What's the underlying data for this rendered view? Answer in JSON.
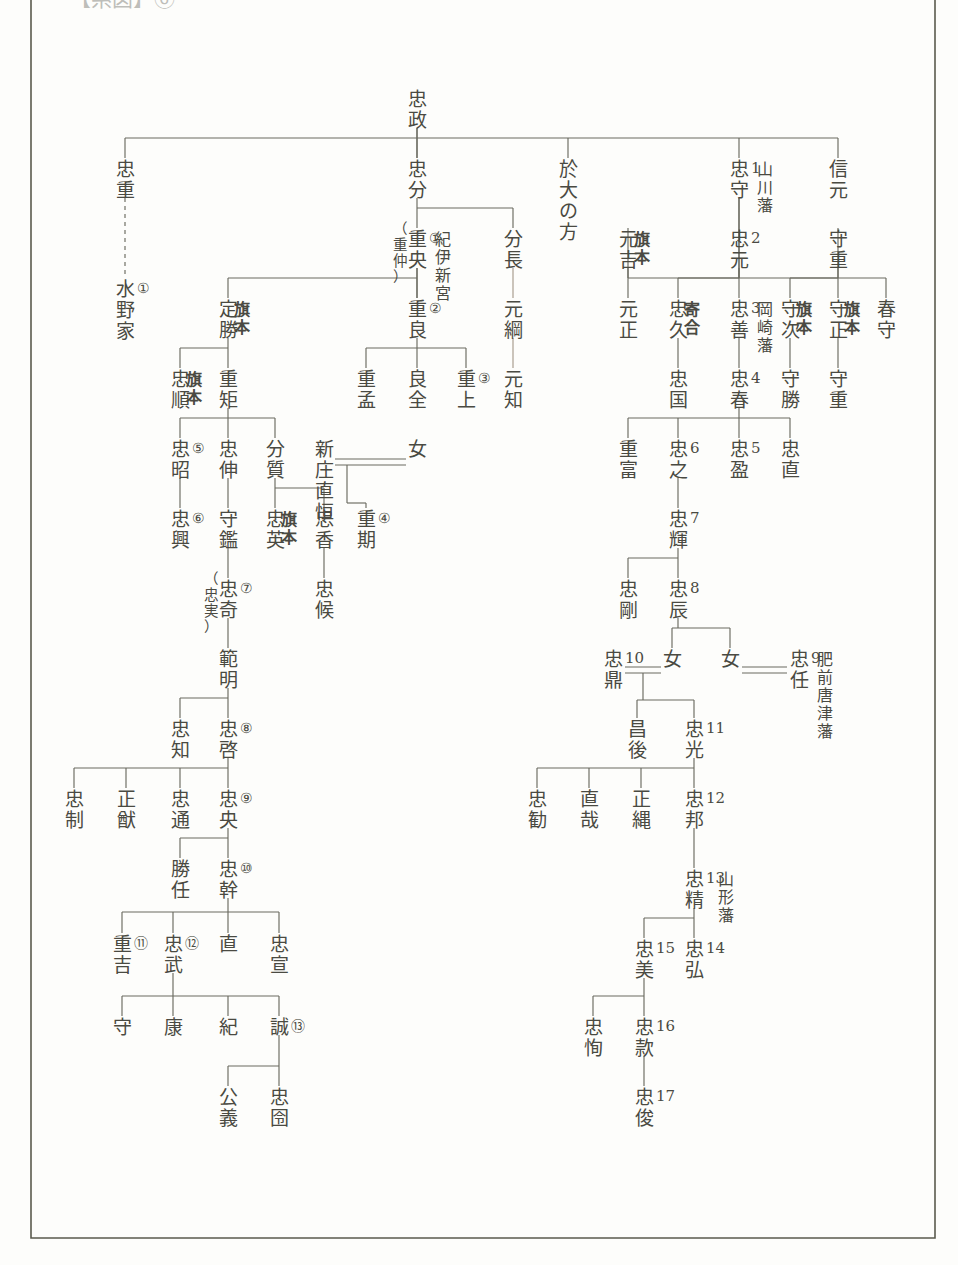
{
  "document": {
    "title": "水野家系図",
    "header_label": "【系図】⑥",
    "family_surname": "水野",
    "ink_color": "#4a4a42",
    "line_color": "#6b6b60",
    "faded_line_color": "#a79a8c",
    "paper_color": "#fdfdfb",
    "border_color": "#5a5a4e"
  },
  "chart_data": {
    "type": "diagram",
    "subtype": "genealogy-tree",
    "orientation": "vertical-japanese",
    "generation_marker_legend": "丸数字=旗本水野家当主順, 算用数字=藩主代数",
    "nodes": [
      {
        "id": "tadamasa",
        "name": "忠政",
        "x": 417,
        "y": 90,
        "marks": [],
        "note": ""
      },
      {
        "id": "tadashige",
        "name": "忠重",
        "x": 125,
        "y": 160,
        "marks": [],
        "note": ""
      },
      {
        "id": "mizunoke",
        "name": "水野家",
        "x": 125,
        "y": 280,
        "marks": [
          "①"
        ],
        "note": "家名"
      },
      {
        "id": "tadabun",
        "name": "忠分",
        "x": 417,
        "y": 160,
        "marks": [],
        "note": ""
      },
      {
        "id": "odainokata",
        "name": "於大の方",
        "x": 568,
        "y": 160,
        "marks": [],
        "note": "女性"
      },
      {
        "id": "tadamori",
        "name": "忠守",
        "x": 739,
        "y": 160,
        "marks": [
          "1"
        ],
        "note": "山川藩"
      },
      {
        "id": "nobumoto",
        "name": "信元",
        "x": 838,
        "y": 160,
        "marks": [],
        "note": ""
      },
      {
        "id": "shigenaka",
        "name": "重央",
        "x": 417,
        "y": 230,
        "marks": [
          "①"
        ],
        "note": "紀伊新宮",
        "alias": "（重仲）"
      },
      {
        "id": "bunchou",
        "name": "分長",
        "x": 513,
        "y": 230,
        "marks": [],
        "note": ""
      },
      {
        "id": "motoyoshi",
        "name": "元吉",
        "x": 628,
        "y": 230,
        "marks": [],
        "note": "旗本"
      },
      {
        "id": "tadamoto",
        "name": "忠元",
        "x": 739,
        "y": 230,
        "marks": [
          "2"
        ],
        "note": ""
      },
      {
        "id": "morishige",
        "name": "守重",
        "x": 838,
        "y": 230,
        "marks": [],
        "note": ""
      },
      {
        "id": "sadakatsu",
        "name": "定勝",
        "x": 228,
        "y": 300,
        "marks": [],
        "note": "旗本"
      },
      {
        "id": "shigeyoshi",
        "name": "重良",
        "x": 417,
        "y": 300,
        "marks": [
          "②"
        ],
        "note": ""
      },
      {
        "id": "mototsuna",
        "name": "元綱",
        "x": 513,
        "y": 300,
        "marks": [],
        "note": ""
      },
      {
        "id": "motomasa",
        "name": "元正",
        "x": 628,
        "y": 300,
        "marks": [],
        "note": ""
      },
      {
        "id": "tadahisa",
        "name": "忠久",
        "x": 678,
        "y": 300,
        "marks": [],
        "note": "寄合"
      },
      {
        "id": "tadayoshi",
        "name": "忠善",
        "x": 739,
        "y": 300,
        "marks": [
          "3"
        ],
        "note": "岡崎藩"
      },
      {
        "id": "moritsugu",
        "name": "守次",
        "x": 790,
        "y": 300,
        "marks": [],
        "note": "旗本"
      },
      {
        "id": "morimasa",
        "name": "守正",
        "x": 838,
        "y": 300,
        "marks": [],
        "note": "旗本"
      },
      {
        "id": "harumori",
        "name": "春守",
        "x": 886,
        "y": 300,
        "marks": [],
        "note": ""
      },
      {
        "id": "tadayori",
        "name": "忠順",
        "x": 180,
        "y": 370,
        "marks": [],
        "note": "旗本"
      },
      {
        "id": "shigenori",
        "name": "重矩",
        "x": 228,
        "y": 370,
        "marks": [],
        "note": ""
      },
      {
        "id": "shigetake",
        "name": "重孟",
        "x": 366,
        "y": 370,
        "marks": [],
        "note": ""
      },
      {
        "id": "yoshimasa",
        "name": "良全",
        "x": 417,
        "y": 370,
        "marks": [],
        "note": ""
      },
      {
        "id": "shigetaka",
        "name": "重上",
        "x": 466,
        "y": 370,
        "marks": [
          "③"
        ],
        "note": ""
      },
      {
        "id": "motochika",
        "name": "元知",
        "x": 513,
        "y": 370,
        "marks": [],
        "note": ""
      },
      {
        "id": "tadaaki",
        "name": "忠昭",
        "x": 180,
        "y": 440,
        "marks": [
          "⑤"
        ],
        "note": ""
      },
      {
        "id": "tadanobu",
        "name": "忠伸",
        "x": 228,
        "y": 440,
        "marks": [],
        "note": ""
      },
      {
        "id": "bunshitsu",
        "name": "分質",
        "x": 275,
        "y": 440,
        "marks": [],
        "note": ""
      },
      {
        "id": "shinjonaotsune",
        "name": "新庄直恒",
        "x": 324,
        "y": 440,
        "marks": [],
        "note": "婚姻相手"
      },
      {
        "id": "musume1",
        "name": "女",
        "x": 417,
        "y": 440,
        "marks": [],
        "note": ""
      },
      {
        "id": "tadakuni",
        "name": "忠国",
        "x": 678,
        "y": 370,
        "marks": [],
        "note": ""
      },
      {
        "id": "tadaharu",
        "name": "忠春",
        "x": 739,
        "y": 370,
        "marks": [
          "4"
        ],
        "note": ""
      },
      {
        "id": "morikatsu",
        "name": "守勝",
        "x": 790,
        "y": 370,
        "marks": [],
        "note": ""
      },
      {
        "id": "morishige2",
        "name": "守重",
        "x": 838,
        "y": 370,
        "marks": [],
        "note": ""
      },
      {
        "id": "tadaoki",
        "name": "忠興",
        "x": 180,
        "y": 510,
        "marks": [
          "⑥"
        ],
        "note": ""
      },
      {
        "id": "morikane",
        "name": "守鑑",
        "x": 228,
        "y": 510,
        "marks": [],
        "note": ""
      },
      {
        "id": "tadahide",
        "name": "忠英",
        "x": 275,
        "y": 510,
        "marks": [],
        "note": "旗本"
      },
      {
        "id": "tadaka",
        "name": "忠香",
        "x": 324,
        "y": 510,
        "marks": [],
        "note": ""
      },
      {
        "id": "shigetoki",
        "name": "重期",
        "x": 366,
        "y": 510,
        "marks": [
          "④"
        ],
        "note": ""
      },
      {
        "id": "shigetomi",
        "name": "重富",
        "x": 628,
        "y": 440,
        "marks": [],
        "note": ""
      },
      {
        "id": "tadayuki",
        "name": "忠之",
        "x": 678,
        "y": 440,
        "marks": [
          "6"
        ],
        "note": ""
      },
      {
        "id": "tadamitsu5",
        "name": "忠盈",
        "x": 739,
        "y": 440,
        "marks": [
          "5"
        ],
        "note": ""
      },
      {
        "id": "tadanao",
        "name": "忠直",
        "x": 790,
        "y": 440,
        "marks": [],
        "note": ""
      },
      {
        "id": "tadaki",
        "name": "忠奇",
        "x": 228,
        "y": 580,
        "marks": [
          "⑦"
        ],
        "note": "",
        "alias": "（忠実）"
      },
      {
        "id": "tadakou",
        "name": "忠候",
        "x": 324,
        "y": 580,
        "marks": [],
        "note": ""
      },
      {
        "id": "tadateru",
        "name": "忠輝",
        "x": 678,
        "y": 510,
        "marks": [
          "7"
        ],
        "note": ""
      },
      {
        "id": "norimasa",
        "name": "範明",
        "x": 228,
        "y": 650,
        "marks": [],
        "note": ""
      },
      {
        "id": "tadatake",
        "name": "忠剛",
        "x": 628,
        "y": 580,
        "marks": [],
        "note": ""
      },
      {
        "id": "tadatatsu",
        "name": "忠辰",
        "x": 678,
        "y": 580,
        "marks": [
          "8"
        ],
        "note": ""
      },
      {
        "id": "tadatomo",
        "name": "忠知",
        "x": 180,
        "y": 720,
        "marks": [],
        "note": ""
      },
      {
        "id": "tadahiro8",
        "name": "忠啓",
        "x": 228,
        "y": 720,
        "marks": [
          "⑧"
        ],
        "note": ""
      },
      {
        "id": "tadakanae",
        "name": "忠鼎",
        "x": 613,
        "y": 650,
        "marks": [
          "10"
        ],
        "note": ""
      },
      {
        "id": "musume2",
        "name": "女",
        "x": 672,
        "y": 650,
        "marks": [],
        "note": ""
      },
      {
        "id": "musume3",
        "name": "女",
        "x": 730,
        "y": 650,
        "marks": [],
        "note": ""
      },
      {
        "id": "tadato9",
        "name": "忠任",
        "x": 799,
        "y": 650,
        "marks": [
          "9"
        ],
        "note": "肥前唐津藩"
      },
      {
        "id": "tadasei",
        "name": "忠制",
        "x": 74,
        "y": 790,
        "marks": [],
        "note": ""
      },
      {
        "id": "masamichi",
        "name": "正猷",
        "x": 126,
        "y": 790,
        "marks": [],
        "note": ""
      },
      {
        "id": "tadamichi",
        "name": "忠通",
        "x": 180,
        "y": 790,
        "marks": [],
        "note": ""
      },
      {
        "id": "tadanaka9",
        "name": "忠央",
        "x": 228,
        "y": 790,
        "marks": [
          "⑨"
        ],
        "note": ""
      },
      {
        "id": "masago",
        "name": "昌後",
        "x": 637,
        "y": 720,
        "marks": [],
        "note": ""
      },
      {
        "id": "tadamitsu11",
        "name": "忠光",
        "x": 694,
        "y": 720,
        "marks": [
          "11"
        ],
        "note": ""
      },
      {
        "id": "katsutou",
        "name": "勝任",
        "x": 180,
        "y": 860,
        "marks": [],
        "note": ""
      },
      {
        "id": "tadamiki",
        "name": "忠幹",
        "x": 228,
        "y": 860,
        "marks": [
          "⑩"
        ],
        "note": ""
      },
      {
        "id": "tadasusume",
        "name": "忠勧",
        "x": 537,
        "y": 790,
        "marks": [],
        "note": ""
      },
      {
        "id": "naoya",
        "name": "直哉",
        "x": 589,
        "y": 790,
        "marks": [],
        "note": ""
      },
      {
        "id": "masanawa",
        "name": "正縄",
        "x": 641,
        "y": 790,
        "marks": [],
        "note": ""
      },
      {
        "id": "tadakuni12",
        "name": "忠邦",
        "x": 694,
        "y": 790,
        "marks": [
          "12"
        ],
        "note": ""
      },
      {
        "id": "shigekichi",
        "name": "重吉",
        "x": 122,
        "y": 935,
        "marks": [
          "⑪"
        ],
        "note": ""
      },
      {
        "id": "tadatake12",
        "name": "忠武",
        "x": 173,
        "y": 935,
        "marks": [
          "⑫"
        ],
        "note": ""
      },
      {
        "id": "nao",
        "name": "直",
        "x": 228,
        "y": 935,
        "marks": [],
        "note": ""
      },
      {
        "id": "tadanobu2",
        "name": "忠宣",
        "x": 279,
        "y": 935,
        "marks": [],
        "note": ""
      },
      {
        "id": "tadakiyo13",
        "name": "忠精",
        "x": 694,
        "y": 870,
        "marks": [
          "13"
        ],
        "note": "山形藩"
      },
      {
        "id": "tadayoshi15",
        "name": "忠美",
        "x": 644,
        "y": 940,
        "marks": [
          "15"
        ],
        "note": ""
      },
      {
        "id": "tadahiro14",
        "name": "忠弘",
        "x": 694,
        "y": 940,
        "marks": [
          "14"
        ],
        "note": ""
      },
      {
        "id": "mamoru",
        "name": "守",
        "x": 122,
        "y": 1018,
        "marks": [],
        "note": ""
      },
      {
        "id": "yasu",
        "name": "康",
        "x": 173,
        "y": 1018,
        "marks": [],
        "note": ""
      },
      {
        "id": "ki",
        "name": "紀",
        "x": 228,
        "y": 1018,
        "marks": [],
        "note": ""
      },
      {
        "id": "makoto13",
        "name": "誠",
        "x": 279,
        "y": 1018,
        "marks": [
          "⑬"
        ],
        "note": ""
      },
      {
        "id": "tadayasu",
        "name": "忠恂",
        "x": 593,
        "y": 1018,
        "marks": [],
        "note": ""
      },
      {
        "id": "tadamoto16",
        "name": "忠款",
        "x": 644,
        "y": 1018,
        "marks": [
          "16"
        ],
        "note": ""
      },
      {
        "id": "kougi",
        "name": "公義",
        "x": 228,
        "y": 1088,
        "marks": [],
        "note": ""
      },
      {
        "id": "tadahiro_last",
        "name": "忠囹",
        "x": 279,
        "y": 1088,
        "marks": [],
        "note": ""
      },
      {
        "id": "tadatoshi17",
        "name": "忠俊",
        "x": 644,
        "y": 1088,
        "marks": [
          "17"
        ],
        "note": ""
      }
    ],
    "side_labels": [
      {
        "for": "tadamori",
        "text": "山川藩"
      },
      {
        "for": "shigenaka",
        "text": "紀伊新宮"
      },
      {
        "for": "tadayoshi",
        "text": "岡崎藩"
      },
      {
        "for": "tadato9",
        "text": "肥前唐津藩"
      },
      {
        "for": "tadakiyo13",
        "text": "山形藩"
      },
      {
        "for": "sadakatsu",
        "text": "旗本"
      },
      {
        "for": "motoyoshi",
        "text": "旗本"
      },
      {
        "for": "tadayori",
        "text": "旗本"
      },
      {
        "for": "tadahide",
        "text": "旗本"
      },
      {
        "for": "tadahisa",
        "text": "寄合"
      },
      {
        "for": "moritsugu",
        "text": "旗本"
      },
      {
        "for": "morimasa",
        "text": "旗本"
      }
    ],
    "marriages": [
      {
        "left": "新庄直恒",
        "right": "女",
        "child": "重期"
      },
      {
        "left": "忠鼎",
        "right": "女",
        "children": [
          "昌後",
          "忠光"
        ]
      },
      {
        "left": "女",
        "right": "忠任",
        "children": []
      }
    ],
    "dashed_links": [
      {
        "from": "忠重",
        "to": "水野家"
      }
    ]
  }
}
